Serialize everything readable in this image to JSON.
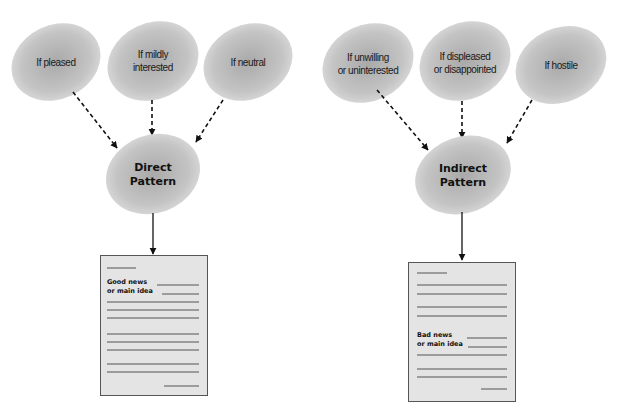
{
  "colors": {
    "ellipse_center": "#a9a9a9",
    "ellipse_edge": "#dcdcdc",
    "document_fill": "#e4e4e4",
    "document_border": "#555555",
    "arrow": "#111111"
  },
  "left_diagram": {
    "conditions": [
      {
        "line1": "If pleased",
        "line2": ""
      },
      {
        "line1": "If mildly",
        "line2": "interested"
      },
      {
        "line1": "If neutral",
        "line2": ""
      }
    ],
    "pattern": {
      "line1": "Direct",
      "line2": "Pattern"
    },
    "document": {
      "line1": "Good news",
      "line2": "or main idea"
    }
  },
  "right_diagram": {
    "conditions": [
      {
        "line1": "If unwilling",
        "line2": "or uninterested"
      },
      {
        "line1": "If displeased",
        "line2": "or disappointed"
      },
      {
        "line1": "If hostile",
        "line2": ""
      }
    ],
    "pattern": {
      "line1": "Indirect",
      "line2": "Pattern"
    },
    "document": {
      "line1": "Bad news",
      "line2": "or main idea"
    }
  }
}
